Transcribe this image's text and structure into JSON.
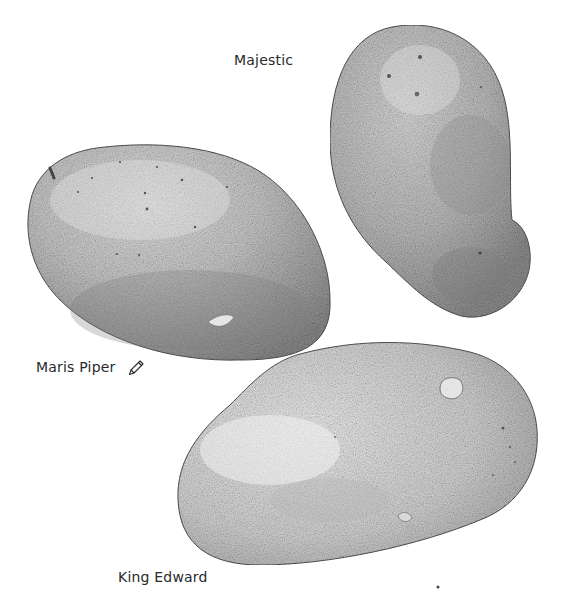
{
  "illustration": {
    "subject": "Pencil drawing of three potato varieties",
    "labels": {
      "majestic": "Majestic",
      "maris_piper": "Maris Piper",
      "king_edward": "King Edward"
    },
    "icons": [
      "pencil-icon"
    ],
    "colors": {
      "background": "#ffffff",
      "potato_light": "#dcdcdc",
      "potato_mid": "#b8b8b8",
      "potato_dark": "#8f8f8f",
      "outline": "#555555",
      "text": "#2a2a2a"
    }
  }
}
